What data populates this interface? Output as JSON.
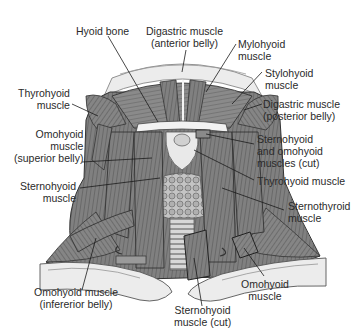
{
  "diagram": {
    "colors": {
      "muscle": "#7d7d7d",
      "muscle_dark": "#555555",
      "muscle_light": "#a8a8a8",
      "skin": "#e6e6e6",
      "bone": "#f0f0f0",
      "line": "#1a1a1a",
      "text": "#2a2a2a"
    },
    "labels": {
      "hyoid_bone": "Hyoid bone",
      "digastric_anterior": "Digastric muscle\n(anterior belly)",
      "mylohyoid": "Mylohyoid\nmuscle",
      "stylohyoid": "Stylohyoid\nmuscle",
      "digastric_posterior": "Digastric muscle\n(posterior belly)",
      "thyrohyoid_left": "Thyrohyoid\nmuscle",
      "omohyoid_superior": "Omohyoid\nmuscle\n(superior belly)",
      "sternohyoid_omohyoid_cut": "Sternohyoid\nand omohyoid\nmuscles (cut)",
      "sternohyoid_left": "Sternohyoid\nmuscle",
      "thyrohyoid_right": "Thyrohyoid muscle",
      "sternothyroid": "Sternothyroid\nmuscle",
      "omohyoid_inferior": "Omohyoid muscle\n(infererior belly)",
      "sternohyoid_cut": "Sternohyoid\nmuscle (cut)",
      "omohyoid_right": "Omohyoid\nmuscle"
    }
  }
}
